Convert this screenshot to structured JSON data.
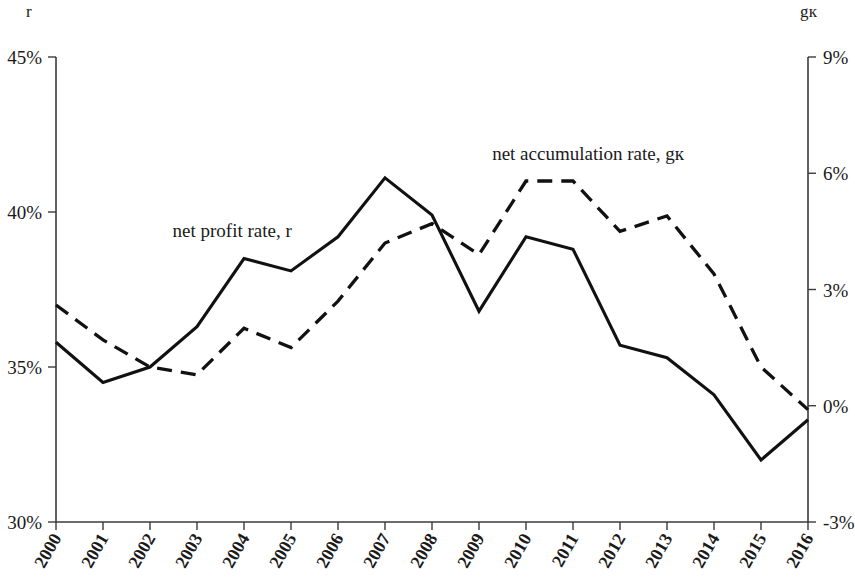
{
  "chart_data": {
    "type": "line",
    "title": "",
    "xlabel": "",
    "ylabel": "r",
    "y2label": "gк",
    "grid": false,
    "legend_position": "inline-annotations",
    "categories": [
      "2000",
      "2001",
      "2002",
      "2003",
      "2004",
      "2005",
      "2006",
      "2007",
      "2008",
      "2009",
      "2010",
      "2011",
      "2012",
      "2013",
      "2014",
      "2015",
      "2016"
    ],
    "left_axis": {
      "label": "r",
      "ticks": [
        "30%",
        "35%",
        "40%",
        "45%"
      ],
      "tick_values": [
        30,
        35,
        40,
        45
      ],
      "ylim": [
        30,
        45
      ]
    },
    "right_axis": {
      "label": "gк",
      "ticks": [
        "-3%",
        "0%",
        "3%",
        "6%",
        "9%"
      ],
      "tick_values": [
        -3,
        0,
        3,
        6,
        9
      ],
      "ylim": [
        -3,
        9
      ]
    },
    "series": [
      {
        "name": "net profit rate, r",
        "axis": "left",
        "style": "solid",
        "label_text": "net profit rate, r",
        "values": [
          35.8,
          34.5,
          35.0,
          36.3,
          38.5,
          38.1,
          39.2,
          41.1,
          39.9,
          36.8,
          39.2,
          38.8,
          35.7,
          35.3,
          34.1,
          32.0,
          33.3
        ]
      },
      {
        "name": "net accumulation rate, gк",
        "axis": "right",
        "style": "dashed",
        "label_text": "net accumulation rate, gк",
        "values": [
          2.6,
          1.7,
          1.0,
          0.8,
          2.0,
          1.5,
          2.7,
          4.2,
          4.7,
          3.9,
          5.8,
          5.8,
          4.5,
          4.9,
          3.4,
          1.0,
          -0.1
        ]
      }
    ],
    "annotations": [
      {
        "text": "net profit rate, r",
        "x_frac": 0.155,
        "y_px": 237
      },
      {
        "text": "net accumulation rate, gк",
        "x_frac": 0.58,
        "y_px": 160
      }
    ]
  },
  "axes": {
    "left_unit": "r",
    "right_unit": "gк"
  }
}
